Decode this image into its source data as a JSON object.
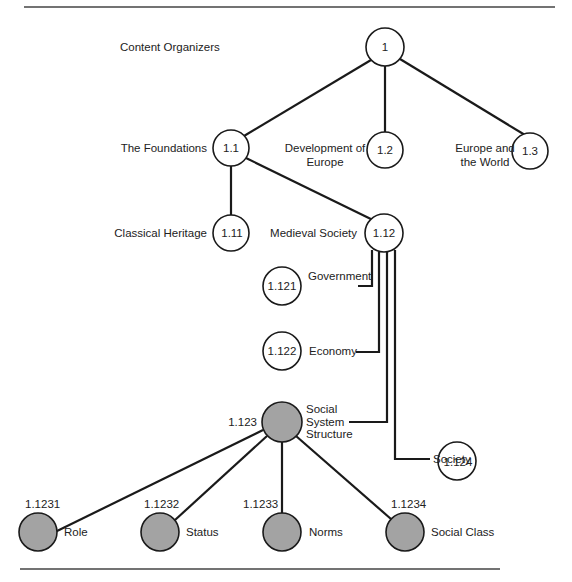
{
  "title": "Content Organizers",
  "colors": {
    "line": "#1a1a1a",
    "filled_node": "#a3a3a3",
    "open_node": "#ffffff",
    "rule": "#444444"
  },
  "nodes": {
    "n1": {
      "id": "1",
      "label": ""
    },
    "n1_1": {
      "id": "1.1",
      "label": "The Foundations"
    },
    "n1_2": {
      "id": "1.2",
      "label_line1": "Development of",
      "label_line2": "Europe"
    },
    "n1_3": {
      "id": "1.3",
      "label_line1": "Europe and",
      "label_line2": "the World"
    },
    "n1_11": {
      "id": "1.11",
      "label": "Classical Heritage"
    },
    "n1_12": {
      "id": "1.12",
      "label": "Medieval Society"
    },
    "n1_121": {
      "id": "1.121",
      "label": "Government"
    },
    "n1_122": {
      "id": "1.122",
      "label": "Economy"
    },
    "n1_123": {
      "id": "1.123",
      "label_line1": "Social",
      "label_line2": "System",
      "label_line3": "Structure"
    },
    "n1_124": {
      "id": "1.124",
      "label": "Society"
    },
    "n1_1231": {
      "id": "1.1231",
      "label": "Role"
    },
    "n1_1232": {
      "id": "1.1232",
      "label": "Status"
    },
    "n1_1233": {
      "id": "1.1233",
      "label": "Norms"
    },
    "n1_1234": {
      "id": "1.1234",
      "label": "Social Class"
    }
  }
}
